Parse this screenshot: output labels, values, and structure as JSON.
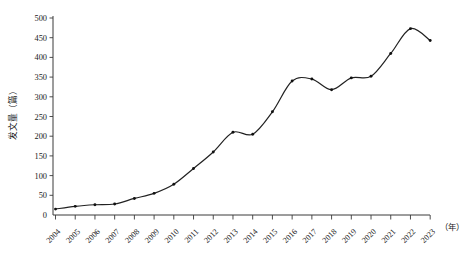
{
  "chart_data": {
    "type": "line",
    "title": "",
    "xlabel": "(年)",
    "ylabel": "发文量（篇）",
    "ylim": [
      0,
      500
    ],
    "xlim": [
      2004,
      2023
    ],
    "ytick_step": 50,
    "grid": false,
    "legend": null,
    "markers": "dot",
    "line_color": "#222222",
    "marker_color": "#111111",
    "categories": [
      "2004",
      "2005",
      "2006",
      "2007",
      "2008",
      "2009",
      "2010",
      "2011",
      "2012",
      "2013",
      "2014",
      "2015",
      "2016",
      "2017",
      "2018",
      "2019",
      "2020",
      "2021",
      "2022",
      "2023"
    ],
    "values": [
      15,
      22,
      26,
      28,
      42,
      55,
      78,
      118,
      160,
      210,
      205,
      262,
      340,
      345,
      318,
      348,
      352,
      410,
      473,
      443
    ],
    "ytick_labels": [
      "0",
      "50",
      "100",
      "150",
      "200",
      "250",
      "300",
      "350",
      "400",
      "450",
      "500"
    ],
    "ytick_values": [
      0,
      50,
      100,
      150,
      200,
      250,
      300,
      350,
      400,
      450,
      500
    ],
    "xtick_labels": [
      "2004",
      "2005",
      "2006",
      "2007",
      "2008",
      "2009",
      "2010",
      "2011",
      "2012",
      "2013",
      "2014",
      "2015",
      "2016",
      "2017",
      "2018",
      "2019",
      "2020",
      "2021",
      "2022",
      "2023"
    ]
  },
  "axes": {
    "y_axis_title": "发文量（篇）",
    "x_axis_unit": "（年）"
  },
  "caption": {
    "text": ""
  }
}
